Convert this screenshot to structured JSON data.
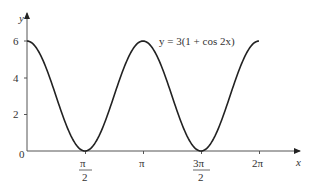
{
  "chart_data": {
    "type": "line",
    "title": "",
    "xlabel": "x",
    "ylabel": "y",
    "annotation": "y = 3(1 + cos 2x)",
    "function": "3*(1+cos(2x))",
    "xlim": [
      0,
      6.2832
    ],
    "ylim": [
      0,
      6
    ],
    "grid": false,
    "legend": "none",
    "x_ticks": [
      {
        "value": 1.5708,
        "label_num": "π",
        "label_den": "2"
      },
      {
        "value": 3.1416,
        "label": "π"
      },
      {
        "value": 4.7124,
        "label_num": "3π",
        "label_den": "2"
      },
      {
        "value": 6.2832,
        "label": "2π"
      }
    ],
    "y_ticks": [
      {
        "value": 0,
        "label": "0"
      },
      {
        "value": 2,
        "label": "2"
      },
      {
        "value": 4,
        "label": "4"
      },
      {
        "value": 6,
        "label": "6"
      }
    ],
    "series": [
      {
        "name": "y = 3(1 + cos 2x)",
        "x": [
          0,
          0.7854,
          1.5708,
          2.3562,
          3.1416,
          3.927,
          4.7124,
          5.4978,
          6.2832
        ],
        "values": [
          6,
          3,
          0,
          3,
          6,
          3,
          0,
          3,
          6
        ]
      }
    ],
    "line_color": "#222222"
  },
  "labels": {
    "x_axis": "x",
    "y_axis": "y",
    "origin": "0",
    "equation": "y = 3(1 + cos 2x)",
    "y2": "2",
    "y4": "4",
    "y6": "6",
    "pi_half_num": "π",
    "pi_half_den": "2",
    "pi": "π",
    "three_pi_half_num": "3π",
    "three_pi_half_den": "2",
    "two_pi": "2π"
  }
}
